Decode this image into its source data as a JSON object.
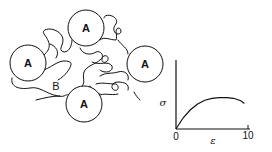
{
  "diagram": {
    "particles": [
      {
        "label": "A",
        "cx": 28,
        "cy": 63,
        "r": 18
      },
      {
        "label": "A",
        "cx": 86,
        "cy": 28,
        "r": 18
      },
      {
        "label": "A",
        "cx": 145,
        "cy": 64,
        "r": 18
      },
      {
        "label": "A",
        "cx": 84,
        "cy": 104,
        "r": 18
      }
    ],
    "matrix_label": "B",
    "line_color": "#111111"
  },
  "chart_data": {
    "type": "line",
    "title": "",
    "xlabel": "ε",
    "ylabel": "σ",
    "x_ticks": [
      "0",
      "10"
    ],
    "xlim": [
      0,
      11
    ],
    "grid": false,
    "legend": null,
    "series": [
      {
        "name": "stress-strain",
        "x": [
          0,
          1,
          2,
          3,
          4,
          5,
          6,
          7,
          8,
          9,
          9.5
        ],
        "y": [
          0,
          0.35,
          0.6,
          0.78,
          0.9,
          0.96,
          0.98,
          0.98,
          0.96,
          0.88,
          0.8
        ]
      }
    ]
  }
}
